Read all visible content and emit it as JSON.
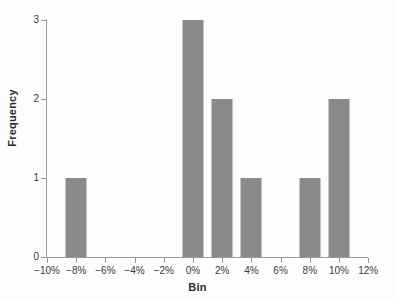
{
  "chart_data": {
    "type": "bar",
    "title": "",
    "xlabel": "Bin",
    "ylabel": "Frequency",
    "categories": [
      "-10%",
      "-8%",
      "-6%",
      "-4%",
      "-2%",
      "0%",
      "2%",
      "4%",
      "6%",
      "8%",
      "10%",
      "12%"
    ],
    "tick_labels_x": [
      "−10%",
      "−8%",
      "−6%",
      "−4%",
      "−2%",
      "0%",
      "2%",
      "4%",
      "6%",
      "8%",
      "10%",
      "12%"
    ],
    "values": [
      0,
      1,
      0,
      0,
      0,
      3,
      2,
      1,
      0,
      1,
      2,
      0
    ],
    "tick_labels_y": [
      "0",
      "1",
      "2",
      "3"
    ],
    "yticks": [
      0,
      1,
      2,
      3
    ],
    "ylim": [
      0,
      3
    ],
    "xlim": [
      "-10%",
      "12%"
    ],
    "grid": false,
    "legend": null,
    "bar_color": "#8a8a8a",
    "axis_color": "#9a9a9a",
    "text_color": "#3a3a3a",
    "background_color": "#fdfdfd"
  }
}
